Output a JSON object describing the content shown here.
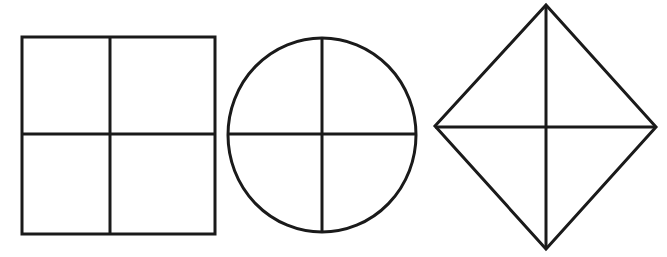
{
  "figure": {
    "background_color": "#ffffff",
    "stroke_color": "#1a1a1a",
    "stroke_width": 3,
    "canvas": {
      "width": 667,
      "height": 257
    },
    "shapes": [
      {
        "id": "square",
        "name": "square-divided-in-fourths",
        "label": "Square",
        "geometry_type": "square",
        "parts": 4,
        "outline": {
          "x": 22,
          "y": 37,
          "width": 193,
          "height": 197
        },
        "center": {
          "x": 110,
          "y": 134
        },
        "dividers": [
          {
            "name": "vertical-divider",
            "x1": 110,
            "y1": 37,
            "x2": 110,
            "y2": 234
          },
          {
            "name": "horizontal-divider",
            "x1": 22,
            "y1": 134,
            "x2": 215,
            "y2": 134
          }
        ]
      },
      {
        "id": "circle",
        "name": "circle-divided-in-fourths",
        "label": "Circle",
        "geometry_type": "circle",
        "parts": 4,
        "outline": {
          "cx": 322,
          "cy": 135,
          "rx": 94,
          "ry": 97
        },
        "center": {
          "x": 322,
          "y": 135
        },
        "dividers": [
          {
            "name": "vertical-divider",
            "x1": 322,
            "y1": 38,
            "x2": 322,
            "y2": 232
          },
          {
            "name": "horizontal-divider",
            "x1": 228,
            "y1": 134,
            "x2": 416,
            "y2": 134
          }
        ]
      },
      {
        "id": "diamond",
        "name": "diamond-divided-in-fourths",
        "label": "Diamond",
        "geometry_type": "rhombus",
        "parts": 4,
        "outline": {
          "points": "546,5 656,127 546,249 435,126"
        },
        "center": {
          "x": 546,
          "y": 127
        },
        "vertices": {
          "top": {
            "x": 546,
            "y": 5
          },
          "right": {
            "x": 656,
            "y": 127
          },
          "bottom": {
            "x": 546,
            "y": 249
          },
          "left": {
            "x": 435,
            "y": 126
          }
        },
        "dividers": [
          {
            "name": "vertical-divider",
            "x1": 546,
            "y1": 5,
            "x2": 546,
            "y2": 249
          },
          {
            "name": "horizontal-divider",
            "x1": 435,
            "y1": 127,
            "x2": 656,
            "y2": 127
          }
        ]
      }
    ]
  }
}
